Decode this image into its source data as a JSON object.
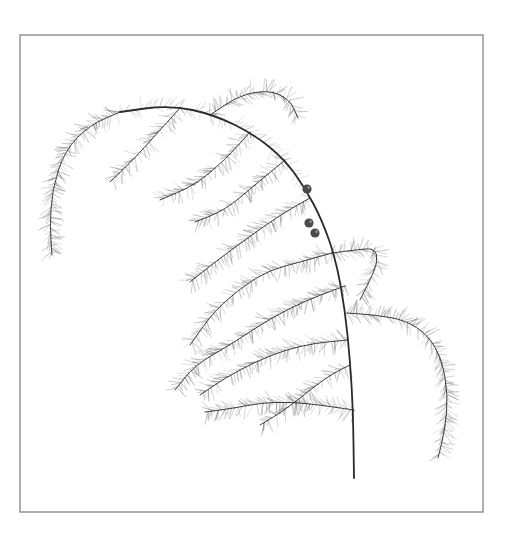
{
  "artwork": {
    "subject": "Asparagus fern sprig with berries",
    "style": "botanical line drawing",
    "colors": {
      "background": "#ffffff",
      "frame": "#7a7a7a",
      "ink": "#2b2b2b",
      "needle": "#555555",
      "berry": "#4a4a4a"
    },
    "berry_count": 3,
    "main_stem": [
      [
        120,
        112
      ],
      [
        170,
        105
      ],
      [
        215,
        115
      ],
      [
        255,
        135
      ],
      [
        285,
        160
      ],
      [
        305,
        188
      ],
      [
        322,
        220
      ],
      [
        336,
        260
      ],
      [
        345,
        310
      ],
      [
        350,
        360
      ],
      [
        353,
        410
      ],
      [
        354,
        478
      ]
    ],
    "branches": [
      {
        "name": "top-left-arch",
        "pts": [
          [
            120,
            112
          ],
          [
            90,
            125
          ],
          [
            65,
            150
          ],
          [
            52,
            190
          ],
          [
            50,
            228
          ],
          [
            52,
            255
          ]
        ],
        "density": 1.0
      },
      {
        "name": "top-center-arch",
        "pts": [
          [
            210,
            115
          ],
          [
            240,
            95
          ],
          [
            270,
            90
          ],
          [
            290,
            100
          ],
          [
            298,
            118
          ]
        ],
        "density": 1.0
      },
      {
        "name": "upper-left-1",
        "pts": [
          [
            180,
            108
          ],
          [
            160,
            130
          ],
          [
            135,
            158
          ],
          [
            110,
            182
          ]
        ],
        "density": 0.8
      },
      {
        "name": "upper-left-2",
        "pts": [
          [
            250,
            132
          ],
          [
            225,
            160
          ],
          [
            195,
            185
          ],
          [
            160,
            200
          ]
        ],
        "density": 0.8
      },
      {
        "name": "upper-mid-1",
        "pts": [
          [
            285,
            160
          ],
          [
            255,
            185
          ],
          [
            225,
            210
          ],
          [
            195,
            222
          ]
        ],
        "density": 0.8
      },
      {
        "name": "mid-left-1",
        "pts": [
          [
            310,
            198
          ],
          [
            280,
            215
          ],
          [
            245,
            240
          ],
          [
            215,
            262
          ],
          [
            190,
            282
          ]
        ],
        "density": 0.9
      },
      {
        "name": "mid-left-2",
        "pts": [
          [
            332,
            253
          ],
          [
            300,
            262
          ],
          [
            270,
            270
          ],
          [
            245,
            285
          ],
          [
            215,
            310
          ],
          [
            190,
            345
          ]
        ],
        "density": 0.9
      },
      {
        "name": "mid-right-loop",
        "pts": [
          [
            332,
            253
          ],
          [
            355,
            250
          ],
          [
            375,
            248
          ],
          [
            378,
            262
          ],
          [
            370,
            280
          ],
          [
            360,
            300
          ]
        ],
        "density": 0.9
      },
      {
        "name": "lower-left-1",
        "pts": [
          [
            345,
            286
          ],
          [
            320,
            295
          ],
          [
            290,
            308
          ],
          [
            260,
            325
          ],
          [
            230,
            345
          ],
          [
            195,
            365
          ],
          [
            175,
            390
          ]
        ],
        "density": 1.0
      },
      {
        "name": "lower-left-2",
        "pts": [
          [
            348,
            340
          ],
          [
            315,
            343
          ],
          [
            285,
            350
          ],
          [
            255,
            362
          ],
          [
            225,
            378
          ],
          [
            200,
            395
          ]
        ],
        "density": 1.0
      },
      {
        "name": "lower-left-3",
        "pts": [
          [
            354,
            410
          ],
          [
            320,
            405
          ],
          [
            290,
            402
          ],
          [
            260,
            403
          ],
          [
            235,
            408
          ],
          [
            205,
            412
          ]
        ],
        "density": 1.0
      },
      {
        "name": "lower-left-4",
        "pts": [
          [
            350,
            365
          ],
          [
            330,
            375
          ],
          [
            310,
            390
          ],
          [
            285,
            410
          ],
          [
            260,
            425
          ]
        ],
        "density": 0.7
      },
      {
        "name": "right-hanging",
        "pts": [
          [
            347,
            313
          ],
          [
            375,
            315
          ],
          [
            405,
            320
          ],
          [
            428,
            335
          ],
          [
            442,
            360
          ],
          [
            448,
            395
          ],
          [
            445,
            430
          ],
          [
            438,
            458
          ]
        ],
        "density": 1.1
      }
    ],
    "berries": [
      [
        307,
        189
      ],
      [
        309,
        223
      ],
      [
        315,
        233
      ]
    ]
  }
}
